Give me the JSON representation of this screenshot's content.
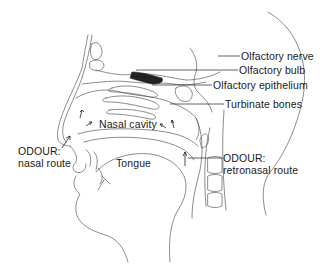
{
  "diagram": {
    "labels": {
      "olfactory_nerve": "Olfactory nerve",
      "olfactory_bulb": "Olfactory bulb",
      "olfactory_epithelium": "Olfactory epithelium",
      "turbinate_bones": "Turbinate bones",
      "nasal_cavity": "Nasal cavity",
      "tongue": "Tongue",
      "nasal_route_line1": "ODOUR:",
      "nasal_route_line2": "nasal route",
      "retronasal_route_line1": "ODOUR:",
      "retronasal_route_line2": "retronasal route"
    },
    "colors": {
      "line": "#555555",
      "text": "#1a1a1a",
      "epithelium": "#222222",
      "background": "#ffffff"
    }
  }
}
